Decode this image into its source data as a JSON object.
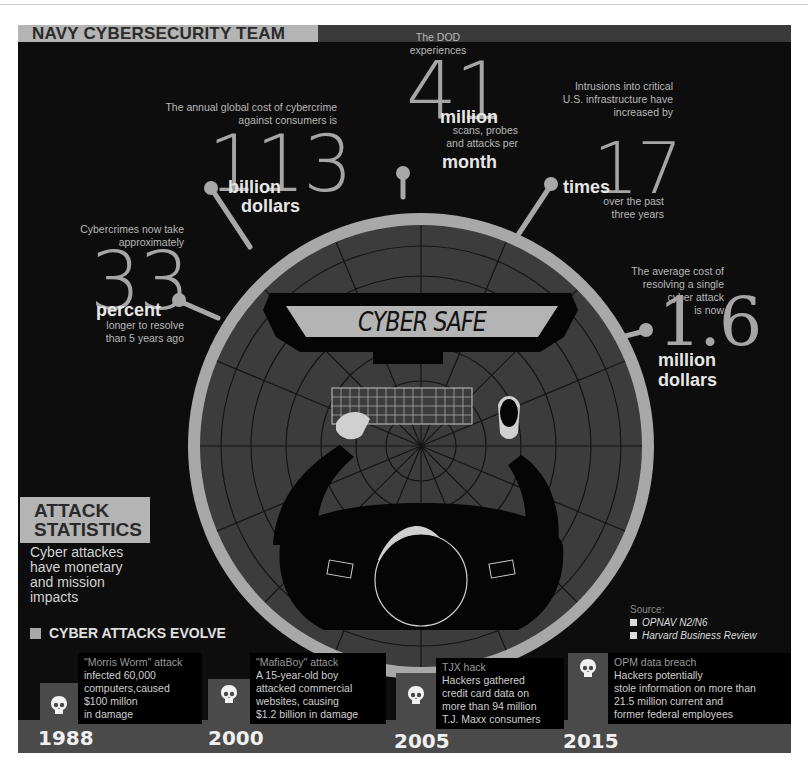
{
  "header": {
    "title": "NAVY CYBERSECURITY TEAM"
  },
  "stats": [
    {
      "intro": [
        "The annual global cost of cybercrime",
        "against consumers is"
      ],
      "number": "113",
      "unit": [
        "billion",
        "dollars"
      ],
      "tail": []
    },
    {
      "intro": [
        "The DOD",
        "experiences"
      ],
      "number": "41",
      "unit": [
        "million"
      ],
      "tail": [
        "scans, probes",
        "and attacks per"
      ],
      "unit2": "month"
    },
    {
      "intro": [
        "Intrusions  into critical",
        "U.S. infrastructure have",
        "increased by"
      ],
      "number": "17",
      "unit": [
        "times"
      ],
      "tail": [
        "over the past",
        "three years"
      ]
    },
    {
      "intro": [
        "Cybercrimes now take",
        "approximately"
      ],
      "number": "33",
      "unit": [
        "percent"
      ],
      "tail": [
        "longer to resolve",
        "than 5 years ago"
      ]
    },
    {
      "intro": [
        "The average cost of",
        "resolving a single",
        "cyber attack",
        "is now"
      ],
      "number": "1.6",
      "unit": [
        "million",
        "dollars"
      ],
      "tail": []
    }
  ],
  "illustration": {
    "sign_text": "CYBER SAFE"
  },
  "attack_statistics": {
    "heading": [
      "ATTACK",
      "STATISTICS"
    ],
    "subtitle": [
      "Cyber attackes",
      "have monetary",
      "and mission",
      "impacts"
    ]
  },
  "sources": {
    "label": "Source:",
    "items": [
      "OPNAV N2/N6",
      "Harvard Business Review"
    ]
  },
  "timeline": {
    "heading": "CYBER ATTACKS EVOLVE",
    "events": [
      {
        "year": "1988",
        "title": "\"Morris Worm\" attack",
        "lines": [
          "infected 60,000",
          "computers,caused",
          "$100 millon",
          "in damage"
        ]
      },
      {
        "year": "2000",
        "title": "\"MafiaBoy\" attack",
        "lines": [
          "A 15-year-old boy",
          "attacked commercial",
          "websites, causing",
          "$1.2 billion in damage"
        ]
      },
      {
        "year": "2005",
        "title": "TJX hack",
        "lines": [
          "Hackers gathered",
          "credit card data on",
          "more than 94 million",
          "T.J. Maxx consumers"
        ]
      },
      {
        "year": "2015",
        "title": "OPM data breach",
        "lines": [
          "Hackers potentially",
          "stole information on more than",
          "21.5 million current and",
          "former federal employees"
        ]
      }
    ]
  },
  "colors": {
    "background": "#0d0d0d",
    "ring": "#a8a8a8",
    "dial": "#3c3c3c",
    "banner": "#b4b4b4",
    "band": "#4a4a4a"
  }
}
